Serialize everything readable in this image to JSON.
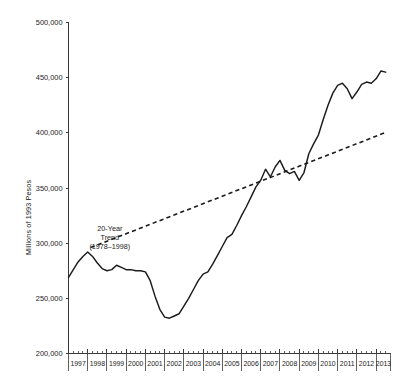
{
  "chart_data": {
    "type": "line",
    "title": "",
    "subtitle": "",
    "xlabel": "",
    "ylabel": "Millions of 1993 Pesos",
    "xlim": [
      1997.0,
      2013.75
    ],
    "ylim": [
      200000,
      500000
    ],
    "grid": false,
    "legend_position": "none",
    "y_ticks": [
      200000,
      250000,
      300000,
      350000,
      400000,
      450000,
      500000
    ],
    "y_tick_labels": [
      "200,000",
      "250,000",
      "300,000",
      "350,000",
      "400,000",
      "450,000",
      "500,000"
    ],
    "x_ticks": [
      1997,
      1998,
      1999,
      2000,
      2001,
      2002,
      2003,
      2004,
      2005,
      2006,
      2007,
      2008,
      2009,
      2010,
      2011,
      2012,
      2013
    ],
    "x_tick_labels": [
      "1997",
      "1998",
      "1999",
      "2000",
      "2001",
      "2002",
      "2003",
      "2004",
      "2005",
      "2006",
      "2007",
      "2008",
      "2009",
      "2010",
      "2011",
      "2012",
      "2013"
    ],
    "x_minor_ticks_per_year": 4,
    "annotations": [
      {
        "name": "trend-annotation",
        "lines": [
          "20-Year",
          "Trend",
          "(1978–1998)"
        ],
        "x": 1999.15,
        "y": 311000
      }
    ],
    "series": [
      {
        "name": "Index",
        "style": "solid",
        "color": "#1b1b1b",
        "x": [
          1997.0,
          1997.25,
          1997.5,
          1997.75,
          1998.0,
          1998.25,
          1998.5,
          1998.75,
          1999.0,
          1999.25,
          1999.5,
          1999.75,
          2000.0,
          2000.25,
          2000.5,
          2000.75,
          2001.0,
          2001.25,
          2001.5,
          2001.75,
          2002.0,
          2002.25,
          2002.5,
          2002.75,
          2003.0,
          2003.25,
          2003.5,
          2003.75,
          2004.0,
          2004.25,
          2004.5,
          2004.75,
          2005.0,
          2005.25,
          2005.5,
          2005.75,
          2006.0,
          2006.25,
          2006.5,
          2006.75,
          2007.0,
          2007.25,
          2007.5,
          2007.75,
          2008.0,
          2008.25,
          2008.5,
          2008.75,
          2009.0,
          2009.25,
          2009.5,
          2009.75,
          2010.0,
          2010.25,
          2010.5,
          2010.75,
          2011.0,
          2011.25,
          2011.5,
          2011.75,
          2012.0,
          2012.25,
          2012.5,
          2012.75,
          2013.0,
          2013.25,
          2013.5
        ],
        "y": [
          269000,
          276000,
          283000,
          288000,
          292000,
          288000,
          282000,
          277000,
          275000,
          276000,
          280000,
          278000,
          276000,
          276000,
          275000,
          275000,
          274000,
          266000,
          252000,
          240000,
          233000,
          232000,
          234000,
          236000,
          243000,
          250000,
          258000,
          266000,
          272000,
          274000,
          281000,
          289000,
          297000,
          305000,
          308000,
          316000,
          325000,
          333000,
          342000,
          351000,
          357000,
          367000,
          360000,
          369000,
          375000,
          366000,
          363000,
          365000,
          357000,
          364000,
          381000,
          390000,
          398000,
          412000,
          425000,
          436000,
          443000,
          445000,
          440000,
          431000,
          437000,
          444000,
          446000,
          445000,
          449000,
          456000,
          455000
        ]
      },
      {
        "name": "20-Year Trend (1978–1998)",
        "style": "dashed",
        "color": "#1b1b1b",
        "x": [
          1998.15,
          2013.45
        ],
        "y": [
          296000,
          400000
        ]
      }
    ]
  },
  "meta": {
    "figure_background": "#ffffff",
    "axis_color": "#3a3a3a",
    "text_color": "#1a1a1a"
  }
}
